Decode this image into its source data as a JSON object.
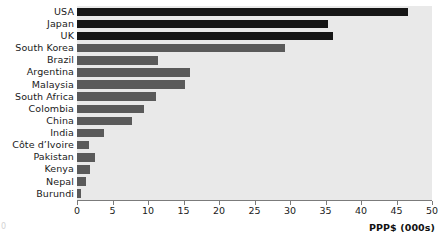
{
  "chart_data": {
    "type": "bar",
    "orientation": "horizontal",
    "title": "",
    "subtitle": "",
    "xlabel": "PPP$ (000s)",
    "ylabel": "",
    "xlim": [
      0,
      50
    ],
    "xticks": [
      0,
      5,
      10,
      15,
      20,
      25,
      30,
      35,
      40,
      45,
      50
    ],
    "xtick_labels": [
      "0",
      "5",
      "10",
      "15",
      "20",
      "25",
      "30",
      "35",
      "40",
      "45",
      "50"
    ],
    "grid": false,
    "legend": null,
    "categories": [
      "USA",
      "Japan",
      "UK",
      "South Korea",
      "Brazil",
      "Argentina",
      "Malaysia",
      "South Africa",
      "Colombia",
      "China",
      "India",
      "Côte d’Ivoire",
      "Pakistan",
      "Kenya",
      "Nepal",
      "Burundi"
    ],
    "values": [
      46.6,
      35.4,
      36.1,
      29.3,
      11.4,
      15.9,
      15.2,
      11.1,
      9.4,
      7.7,
      3.8,
      1.7,
      2.6,
      1.8,
      1.2,
      0.5
    ],
    "bar_colors": [
      "#161616",
      "#161616",
      "#161616",
      "#5a5a5a",
      "#5a5a5a",
      "#5a5a5a",
      "#5a5a5a",
      "#5a5a5a",
      "#5a5a5a",
      "#5a5a5a",
      "#5a5a5a",
      "#5a5a5a",
      "#5a5a5a",
      "#5a5a5a",
      "#5a5a5a",
      "#5a5a5a"
    ],
    "plot_background": "#e9e9e9",
    "axis_color": "#7b7b7b"
  },
  "artifacts": {
    "corner_mark": "0"
  }
}
